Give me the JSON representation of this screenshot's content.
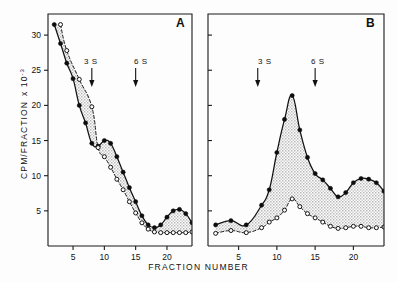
{
  "figure": {
    "xlabel": "FRACTION NUMBER",
    "ylabel_main": "CPM/FRACTION",
    "ylabel_exp": "x 10",
    "ylabel_sup": "-3",
    "panel_a_label": "A",
    "panel_b_label": "B",
    "marker_3s": "3 S",
    "marker_6s": "6 S",
    "tick_5": "5",
    "tick_10": "10",
    "tick_15": "15",
    "tick_20": "20",
    "ytick_5": "5",
    "ytick_10": "10",
    "ytick_15": "15",
    "ytick_20": "20",
    "ytick_25": "25",
    "ytick_30": "30"
  },
  "chart_data": {
    "type": "line",
    "title": "",
    "xlabel": "FRACTION NUMBER",
    "ylabel": "CPM/FRACTION x 10^-3",
    "xlim": [
      1,
      24
    ],
    "ylim": [
      0,
      33
    ],
    "xticks": [
      5,
      10,
      15,
      20
    ],
    "yticks": [
      5,
      10,
      15,
      20,
      25,
      30
    ],
    "grid": false,
    "legend": "none",
    "shared_y_axis": "left panel only",
    "fill_between_series": true,
    "fill_style": "stippled grey",
    "panels": [
      {
        "label": "A",
        "annotations": [
          {
            "text": "3 S",
            "x": 8.0,
            "type": "arrow-down"
          },
          {
            "text": "6 S",
            "x": 15.0,
            "type": "arrow-down"
          }
        ],
        "series": [
          {
            "name": "filled-circles",
            "marker": "filled circle",
            "linestyle": "solid",
            "x": [
              2,
              3,
              4,
              5,
              6,
              7,
              8,
              9,
              10,
              11,
              12,
              13,
              14,
              15,
              16,
              17,
              18,
              19,
              20,
              21,
              22,
              23,
              24
            ],
            "y": [
              31.5,
              28.8,
              26.0,
              23.8,
              20.0,
              17.5,
              14.6,
              14.2,
              15.0,
              14.6,
              12.7,
              10.5,
              8.3,
              6.3,
              4.3,
              3.0,
              2.6,
              3.0,
              4.1,
              5.0,
              5.2,
              4.6,
              3.3
            ]
          },
          {
            "name": "open-circles",
            "marker": "open circle",
            "linestyle": "dashed",
            "x": [
              3,
              4,
              6,
              8,
              9,
              10,
              11,
              12,
              13,
              14,
              15,
              16,
              17,
              18,
              19,
              20,
              21,
              22,
              23,
              24
            ],
            "y": [
              31.5,
              27.8,
              23.7,
              19.8,
              14.0,
              12.7,
              11.2,
              9.5,
              8.0,
              6.3,
              4.7,
              3.3,
              2.4,
              2.0,
              1.9,
              1.9,
              1.9,
              1.9,
              1.9,
              2.0
            ]
          }
        ]
      },
      {
        "label": "B",
        "annotations": [
          {
            "text": "3 S",
            "x": 7.5,
            "type": "arrow-down"
          },
          {
            "text": "6 S",
            "x": 15.0,
            "type": "arrow-down"
          }
        ],
        "series": [
          {
            "name": "filled-circles",
            "marker": "filled circle",
            "linestyle": "solid",
            "x": [
              2,
              4,
              6,
              8,
              9,
              10,
              11,
              12,
              13,
              14,
              15,
              16,
              17,
              18,
              19,
              20,
              21,
              22,
              23,
              24
            ],
            "y": [
              3.0,
              3.6,
              3.0,
              5.8,
              8.0,
              13.3,
              18.0,
              21.4,
              16.5,
              12.6,
              10.3,
              9.4,
              8.2,
              7.0,
              7.6,
              9.0,
              9.6,
              9.5,
              9.0,
              7.8
            ]
          },
          {
            "name": "open-circles",
            "marker": "open circle",
            "linestyle": "dashed",
            "x": [
              2,
              4,
              6,
              8,
              9,
              10,
              11,
              12,
              13,
              14,
              15,
              16,
              17,
              18,
              19,
              20,
              21,
              22,
              23,
              24
            ],
            "y": [
              1.8,
              2.2,
              1.9,
              2.6,
              3.4,
              4.0,
              5.1,
              6.7,
              5.6,
              4.6,
              4.0,
              3.4,
              2.8,
              2.5,
              2.6,
              2.8,
              2.8,
              2.6,
              2.6,
              2.7
            ]
          }
        ]
      }
    ]
  }
}
